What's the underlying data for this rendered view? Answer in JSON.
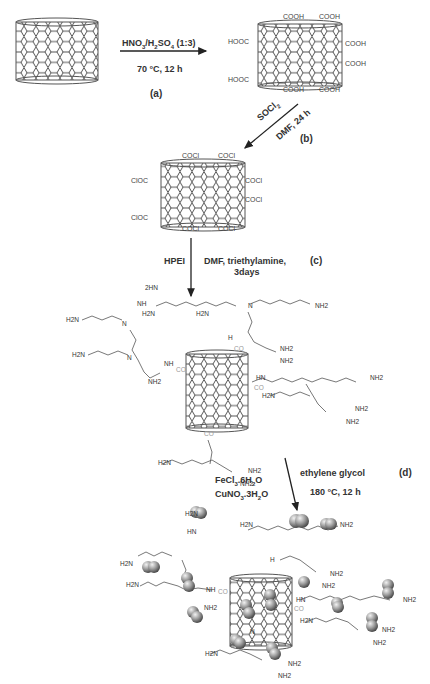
{
  "diagram": {
    "type": "reaction-scheme",
    "steps": [
      {
        "id": "a",
        "label": "(a)",
        "reagent": "HNO3/H2SO4 (1:3)",
        "conditions": "70 °C, 12 h",
        "from": "pristine CNT",
        "to": "CNT-COOH"
      },
      {
        "id": "b",
        "label": "(b)",
        "reagent": "SOCl2",
        "conditions": "DMF, 24 h",
        "from": "CNT-COOH",
        "to": "CNT-COCl"
      },
      {
        "id": "c",
        "label": "(c)",
        "reagent": "HPEI",
        "conditions": "DMF, triethylamine, 3days",
        "from": "CNT-COCl",
        "to": "CNT-HPEI"
      },
      {
        "id": "d",
        "label": "(d)",
        "reagent_lines": [
          "FeCl3.6H2O",
          "CuNO3.3H2O"
        ],
        "conditions_lines": [
          "ethylene glycol",
          "180 °C, 12 h"
        ],
        "from": "CNT-HPEI",
        "to": "CNT-HPEI with metal nanoparticles"
      }
    ],
    "groups": {
      "cooh": "COOH",
      "hooc": "HOOC",
      "cocl": "COCl",
      "cloc": "ClOC",
      "co": "CO",
      "nh2": "NH2",
      "h2n": "H2N",
      "nh": "NH",
      "hn": "HN",
      "n": "N",
      "h": "H",
      "twohn": "2HN"
    }
  },
  "text": {
    "step_a_reagent_html": "HNO<sub>3</sub>/H<sub>2</sub>SO<sub>4</sub> (1:3)",
    "step_a_cond": "70 °C, 12 h",
    "step_a_label": "(a)",
    "step_b_reagent": "SOCl2",
    "step_b_cond": "DMF, 24 h",
    "step_b_label": "(b)",
    "step_c_reagent": "HPEI",
    "step_c_cond1": "DMF, triethylamine,",
    "step_c_cond2": "3days",
    "step_c_label": "(c)",
    "step_d_reagent1": "FeCl3.6H2O",
    "step_d_reagent2": "CuNO3.3H2O",
    "step_d_cond1": "ethylene glycol",
    "step_d_cond2": "180 °C, 12 h",
    "step_d_label": "(d)"
  }
}
